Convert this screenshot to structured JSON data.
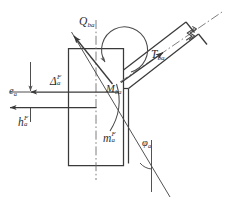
{
  "figure": {
    "type": "engineering-line-diagram",
    "width": 229,
    "height": 202,
    "background": "#ffffff",
    "line_color": "#3a3a3a",
    "thin_line_color": "#6a6a6a",
    "label_color": "#2b2b2b"
  },
  "labels": {
    "shear_force": {
      "base": "Q",
      "sub": "ba",
      "sup": ""
    },
    "axial_force": {
      "base": "T",
      "sub": "ba",
      "sup": ""
    },
    "moment_joint": {
      "base": "M",
      "sub": "ba",
      "sup": ""
    },
    "fixed_end_moment": {
      "base": "m",
      "sub": "a",
      "sup": "F"
    },
    "sway_displacement": {
      "base": "Δ",
      "sub": "a",
      "sup": "F"
    },
    "story_height": {
      "base": "h",
      "sub": "a",
      "sup": "F"
    },
    "eccentricity": {
      "base": "e",
      "sub": "a",
      "sup": ""
    },
    "inclination_angle": {
      "base": "φ",
      "sub": "a",
      "sup": ""
    }
  },
  "annotations": {
    "break_symbol": "zigzag-break",
    "centerline_style": "dash-dot",
    "column_outline": "rectangle",
    "beam_outline": "inclined-parallel-pair"
  }
}
